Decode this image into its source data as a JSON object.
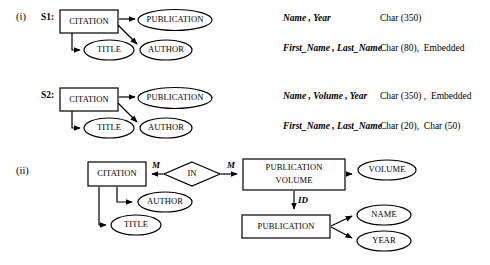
{
  "figure": {
    "part_one_label": "(i)",
    "part_two_label": "(ii)"
  },
  "part_one": {
    "schemas": [
      {
        "name": "S1:",
        "diagram": {
          "entity": "CITATION",
          "attributes": [
            "PUBLICATION",
            "TITLE",
            "AUTHOR"
          ]
        },
        "rows": [
          {
            "attributes": "Name , Year",
            "types": "Char (350)"
          },
          {
            "attributes": "First_Name , Last_Name",
            "types": "Char (80),  Embedded"
          }
        ]
      },
      {
        "name": "S2:",
        "diagram": {
          "entity": "CITATION",
          "attributes": [
            "PUBLICATION",
            "TITLE",
            "AUTHOR"
          ]
        },
        "rows": [
          {
            "attributes": "Name , Volume , Year",
            "types": "Char (350) ,  Embedded"
          },
          {
            "attributes": "First_Name , Last_Name",
            "types": "Char (20),  Char (50)"
          }
        ]
      }
    ]
  },
  "part_two": {
    "entities": {
      "citation": "CITATION",
      "publication_volume_line1": "PUBLICATION",
      "publication_volume_line2": "VOLUME",
      "publication": "PUBLICATION"
    },
    "relationship": "IN",
    "attributes": {
      "author": "AUTHOR",
      "title": "TITLE",
      "volume": "VOLUME",
      "name": "NAME",
      "year": "YEAR"
    },
    "cardinalities": {
      "left": "M",
      "right": "M"
    },
    "link_label": "ID"
  },
  "colors": {
    "stroke": "#000000",
    "fill": "#ffffff",
    "background": "#ffffff"
  }
}
